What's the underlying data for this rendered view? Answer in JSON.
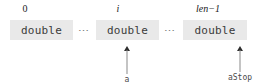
{
  "diagram": {
    "background_color": "#ffffff",
    "cell_fill_color": "#e9e9e9",
    "cells": [
      {
        "index_label": "0",
        "type_label": "double"
      },
      {
        "index_label": "i",
        "type_label": "double"
      },
      {
        "index_label": "len−1",
        "type_label": "double"
      }
    ],
    "separators": [
      {
        "glyph": "⋯"
      },
      {
        "glyph": "⋯"
      }
    ],
    "pointers": [
      {
        "label": "a",
        "target_index_label": "i"
      },
      {
        "label": "aStop",
        "target_index_label": "len−1"
      }
    ]
  }
}
